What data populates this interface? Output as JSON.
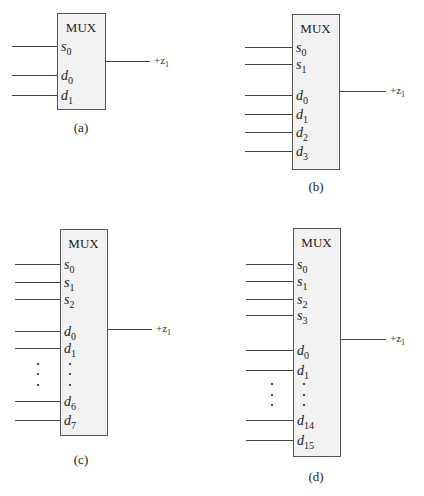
{
  "figure": {
    "output_label": "+z",
    "output_sub": "1",
    "block_title": "MUX",
    "panels": [
      {
        "id": "a",
        "caption": "(a)",
        "box": {
          "x": 57,
          "y": 13,
          "w": 48,
          "h": 96
        },
        "input_x": 12,
        "output": {
          "y": 61,
          "x2": 150
        },
        "pins": [
          {
            "base": "s",
            "sub": "0",
            "y": 46
          },
          {
            "base": "d",
            "sub": "0",
            "y": 75
          },
          {
            "base": "d",
            "sub": "1",
            "y": 95
          }
        ],
        "ellipsis": null,
        "caption_pos": {
          "x": 81,
          "y": 132
        }
      },
      {
        "id": "b",
        "caption": "(b)",
        "box": {
          "x": 292,
          "y": 14,
          "w": 47,
          "h": 155
        },
        "input_x": 245,
        "output": {
          "y": 91,
          "x2": 386
        },
        "pins": [
          {
            "base": "s",
            "sub": "0",
            "y": 47
          },
          {
            "base": "s",
            "sub": "1",
            "y": 64
          },
          {
            "base": "d",
            "sub": "0",
            "y": 95
          },
          {
            "base": "d",
            "sub": "1",
            "y": 114
          },
          {
            "base": "d",
            "sub": "2",
            "y": 132
          },
          {
            "base": "d",
            "sub": "3",
            "y": 151
          }
        ],
        "ellipsis": null,
        "caption_pos": {
          "x": 316,
          "y": 191
        }
      },
      {
        "id": "c",
        "caption": "(c)",
        "box": {
          "x": 60,
          "y": 229,
          "w": 47,
          "h": 206
        },
        "input_x": 15,
        "output": {
          "y": 329,
          "x2": 152
        },
        "pins": [
          {
            "base": "s",
            "sub": "0",
            "y": 264
          },
          {
            "base": "s",
            "sub": "1",
            "y": 282
          },
          {
            "base": "s",
            "sub": "2",
            "y": 299
          },
          {
            "base": "d",
            "sub": "0",
            "y": 331
          },
          {
            "base": "d",
            "sub": "1",
            "y": 348
          },
          {
            "base": "d",
            "sub": "6",
            "y": 401
          },
          {
            "base": "d",
            "sub": "7",
            "y": 420
          }
        ],
        "ellipsis": {
          "outer_x": 38,
          "inner_x": 70,
          "ys": [
            364,
            374,
            385
          ]
        },
        "caption_pos": {
          "x": 81,
          "y": 464
        }
      },
      {
        "id": "d",
        "caption": "(d)",
        "box": {
          "x": 293,
          "y": 228,
          "w": 47,
          "h": 228
        },
        "input_x": 246,
        "output": {
          "y": 339,
          "x2": 386
        },
        "pins": [
          {
            "base": "s",
            "sub": "0",
            "y": 264
          },
          {
            "base": "s",
            "sub": "1",
            "y": 281
          },
          {
            "base": "s",
            "sub": "2",
            "y": 299
          },
          {
            "base": "s",
            "sub": "3",
            "y": 315
          },
          {
            "base": "d",
            "sub": "0",
            "y": 350
          },
          {
            "base": "d",
            "sub": "1",
            "y": 370
          },
          {
            "base": "d",
            "sub": "14",
            "y": 420
          },
          {
            "base": "d",
            "sub": "15",
            "y": 440
          }
        ],
        "ellipsis": {
          "outer_x": 272,
          "inner_x": 304,
          "ys": [
            384,
            395,
            405
          ]
        },
        "caption_pos": {
          "x": 316,
          "y": 481
        }
      }
    ]
  }
}
